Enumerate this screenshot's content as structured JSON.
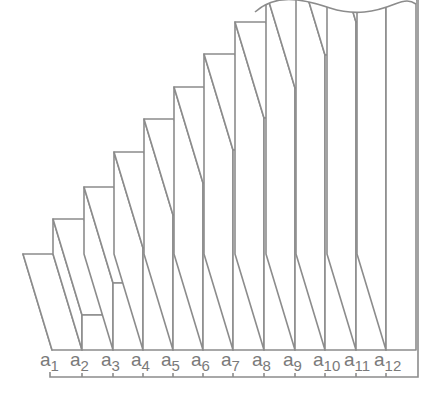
{
  "diagram": {
    "title": "",
    "stroke_color": "#8c8c8c",
    "label_color": "#7a7a7a",
    "background": "#ffffff",
    "depth_offset": {
      "dx": -29,
      "dy": -96
    },
    "baseline_y": 350,
    "axis_y": 377,
    "axis_start_x": 50,
    "axis_end_x": 418,
    "bars": [
      {
        "label": "a",
        "subscript": "1",
        "x0": 52,
        "x1": 82,
        "top": 350
      },
      {
        "label": "a",
        "subscript": "2",
        "x0": 82,
        "x1": 113,
        "top": 315
      },
      {
        "label": "a",
        "subscript": "3",
        "x0": 113,
        "x1": 143,
        "top": 283
      },
      {
        "label": "a",
        "subscript": "4",
        "x0": 143,
        "x1": 173,
        "top": 248
      },
      {
        "label": "a",
        "subscript": "5",
        "x0": 173,
        "x1": 203,
        "top": 215
      },
      {
        "label": "a",
        "subscript": "6",
        "x0": 203,
        "x1": 233,
        "top": 183
      },
      {
        "label": "a",
        "subscript": "7",
        "x0": 233,
        "x1": 264,
        "top": 150
      },
      {
        "label": "a",
        "subscript": "8",
        "x0": 264,
        "x1": 295,
        "top": 118
      },
      {
        "label": "a",
        "subscript": "9",
        "x0": 295,
        "x1": 325,
        "top": 88
      },
      {
        "label": "a",
        "subscript": "10",
        "x0": 325,
        "x1": 356,
        "top": 55
      },
      {
        "label": "a",
        "subscript": "11",
        "x0": 356,
        "x1": 386,
        "top": 22
      },
      {
        "label": "a",
        "subscript": "12",
        "x0": 386,
        "x1": 416,
        "top": 0
      }
    ],
    "labels": [
      "a1",
      "a2",
      "a3",
      "a4",
      "a5",
      "a6",
      "a7",
      "a8",
      "a9",
      "a10",
      "a11",
      "a12"
    ]
  }
}
